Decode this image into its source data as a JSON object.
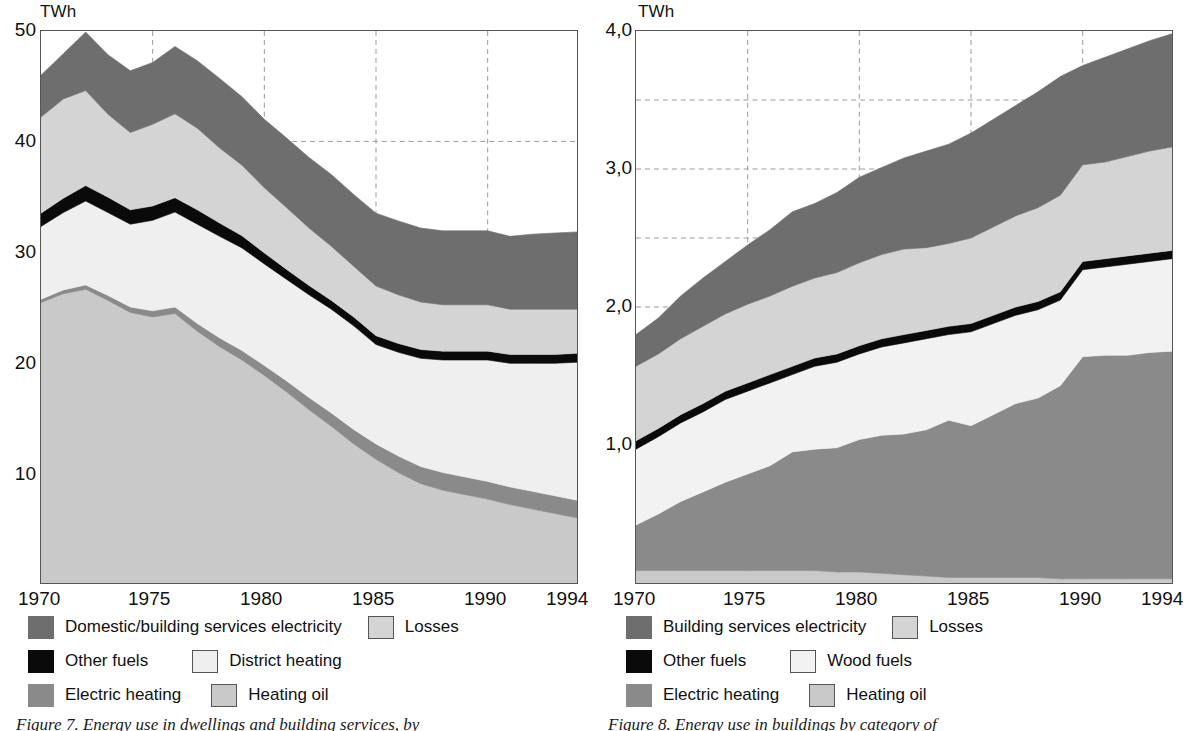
{
  "colors": {
    "services_electricity": "#6e6e6e",
    "losses": "#d4d4d4",
    "other_fuels": "#0a0a0a",
    "district_heating": "#efefef",
    "wood_fuels": "#f2f2f2",
    "electric_heating": "#8a8a8a",
    "heating_oil": "#c9c9c9",
    "axis": "#555555",
    "grid": "#9a9a9a",
    "text": "#111111"
  },
  "left": {
    "unit": "TWh",
    "yticks": [
      "50",
      "40",
      "30",
      "20",
      "10"
    ],
    "xticks": [
      "1970",
      "1975",
      "1980",
      "1985",
      "1990",
      "1994"
    ],
    "legend": [
      {
        "label": "Domestic/building services electricity",
        "swatch": "services_electricity",
        "bordered": false
      },
      {
        "label": "Losses",
        "swatch": "losses",
        "bordered": true
      },
      {
        "label": "Other fuels",
        "swatch": "other_fuels",
        "bordered": false
      },
      {
        "label": "District heating",
        "swatch": "district_heating",
        "bordered": true
      },
      {
        "label": "Electric heating",
        "swatch": "electric_heating",
        "bordered": false
      },
      {
        "label": "Heating oil",
        "swatch": "heating_oil",
        "bordered": true
      }
    ],
    "caption": "Figure 7. Energy use in dwellings and building services, by"
  },
  "right": {
    "unit": "TWh",
    "yticks": [
      "4,0",
      "3,0",
      "2,0",
      "1,0"
    ],
    "xticks": [
      "1970",
      "1975",
      "1980",
      "1985",
      "1990",
      "1994"
    ],
    "legend": [
      {
        "label": "Building services electricity",
        "swatch": "services_electricity",
        "bordered": false
      },
      {
        "label": "Losses",
        "swatch": "losses",
        "bordered": true
      },
      {
        "label": "Other fuels",
        "swatch": "other_fuels",
        "bordered": false
      },
      {
        "label": "Wood fuels",
        "swatch": "wood_fuels",
        "bordered": true
      },
      {
        "label": "Electric heating",
        "swatch": "electric_heating",
        "bordered": false
      },
      {
        "label": "Heating oil",
        "swatch": "heating_oil",
        "bordered": true
      }
    ],
    "caption": "Figure 8. Energy use in buildings by category of"
  },
  "chart_data": [
    {
      "id": "left-chart",
      "type": "area",
      "title": "",
      "xlabel": "",
      "ylabel": "TWh",
      "unit": "TWh",
      "stacked": true,
      "grid": "dashed",
      "legend_position": "below",
      "xlim": [
        1970,
        1994
      ],
      "ylim": [
        0,
        50
      ],
      "ytick_values": [
        10,
        20,
        30,
        40,
        50
      ],
      "xtick_values": [
        1970,
        1975,
        1980,
        1985,
        1990,
        1994
      ],
      "x": [
        1970,
        1971,
        1972,
        1973,
        1974,
        1975,
        1976,
        1977,
        1978,
        1979,
        1980,
        1981,
        1982,
        1983,
        1984,
        1985,
        1986,
        1987,
        1988,
        1989,
        1990,
        1991,
        1992,
        1993,
        1994
      ],
      "series": [
        {
          "name": "Heating oil",
          "color_key": "heating_oil",
          "values": [
            25.4,
            26.2,
            26.6,
            25.6,
            24.5,
            24.1,
            24.4,
            22.8,
            21.4,
            20.2,
            18.8,
            17.3,
            15.7,
            14.2,
            12.6,
            11.2,
            10.0,
            9.0,
            8.4,
            8.0,
            7.6,
            7.1,
            6.7,
            6.3,
            5.9
          ]
        },
        {
          "name": "Electric heating",
          "color_key": "electric_heating",
          "values": [
            0.3,
            0.35,
            0.4,
            0.45,
            0.5,
            0.55,
            0.6,
            0.7,
            0.8,
            0.85,
            0.9,
            1.0,
            1.1,
            1.2,
            1.3,
            1.4,
            1.5,
            1.55,
            1.6,
            1.6,
            1.6,
            1.6,
            1.6,
            1.6,
            1.6
          ]
        },
        {
          "name": "District heating",
          "color_key": "district_heating",
          "values": [
            6.6,
            7.0,
            7.6,
            7.5,
            7.5,
            8.2,
            8.6,
            9.0,
            9.2,
            9.3,
            9.2,
            9.2,
            9.3,
            9.4,
            9.4,
            9.0,
            9.4,
            9.8,
            10.2,
            10.6,
            11.0,
            11.2,
            11.6,
            12.0,
            12.5
          ]
        },
        {
          "name": "Other fuels",
          "color_key": "other_fuels",
          "values": [
            1.2,
            1.3,
            1.4,
            1.4,
            1.3,
            1.3,
            1.3,
            1.3,
            1.2,
            1.1,
            1.0,
            0.9,
            0.85,
            0.8,
            0.8,
            0.8,
            0.8,
            0.8,
            0.8,
            0.8,
            0.8,
            0.8,
            0.8,
            0.8,
            0.8
          ]
        },
        {
          "name": "Losses",
          "color_key": "losses",
          "values": [
            8.7,
            9.0,
            8.6,
            7.5,
            7.0,
            7.4,
            7.6,
            7.4,
            6.8,
            6.4,
            5.9,
            5.6,
            5.2,
            4.9,
            4.6,
            4.5,
            4.4,
            4.3,
            4.2,
            4.2,
            4.2,
            4.1,
            4.1,
            4.1,
            4.0
          ]
        },
        {
          "name": "Domestic/building services electricity",
          "color_key": "services_electricity",
          "values": [
            3.8,
            4.1,
            5.3,
            5.4,
            5.6,
            5.6,
            6.1,
            6.1,
            6.3,
            6.2,
            6.2,
            6.3,
            6.4,
            6.5,
            6.5,
            6.6,
            6.7,
            6.7,
            6.7,
            6.7,
            6.7,
            6.6,
            6.8,
            6.9,
            7.0
          ]
        }
      ]
    },
    {
      "id": "right-chart",
      "type": "area",
      "title": "",
      "xlabel": "",
      "ylabel": "TWh",
      "unit": "TWh",
      "stacked": true,
      "grid": "dashed",
      "legend_position": "below",
      "xlim": [
        1970,
        1994
      ],
      "ylim": [
        0,
        4.0
      ],
      "ytick_values": [
        1.0,
        2.0,
        3.0,
        4.0
      ],
      "minor_gridlines": [
        2.5,
        3.5
      ],
      "xtick_values": [
        1970,
        1975,
        1980,
        1985,
        1990,
        1994
      ],
      "x": [
        1970,
        1971,
        1972,
        1973,
        1974,
        1975,
        1976,
        1977,
        1978,
        1979,
        1980,
        1981,
        1982,
        1983,
        1984,
        1985,
        1986,
        1987,
        1988,
        1989,
        1990,
        1991,
        1992,
        1993,
        1994
      ],
      "series": [
        {
          "name": "Heating oil",
          "color_key": "heating_oil",
          "values": [
            0.09,
            0.09,
            0.09,
            0.09,
            0.09,
            0.09,
            0.09,
            0.09,
            0.09,
            0.08,
            0.08,
            0.07,
            0.06,
            0.05,
            0.04,
            0.04,
            0.04,
            0.04,
            0.04,
            0.03,
            0.03,
            0.03,
            0.03,
            0.03,
            0.03
          ]
        },
        {
          "name": "Electric heating",
          "color_key": "electric_heating",
          "values": [
            0.33,
            0.41,
            0.5,
            0.57,
            0.64,
            0.7,
            0.76,
            0.86,
            0.88,
            0.9,
            0.96,
            1.0,
            1.02,
            1.06,
            1.14,
            1.1,
            1.18,
            1.26,
            1.3,
            1.4,
            1.61,
            1.62,
            1.62,
            1.64,
            1.65
          ]
        },
        {
          "name": "Wood fuels",
          "color_key": "wood_fuels",
          "values": [
            0.55,
            0.56,
            0.57,
            0.58,
            0.6,
            0.6,
            0.6,
            0.56,
            0.6,
            0.62,
            0.62,
            0.64,
            0.66,
            0.66,
            0.62,
            0.68,
            0.66,
            0.64,
            0.64,
            0.62,
            0.63,
            0.64,
            0.66,
            0.66,
            0.67
          ]
        },
        {
          "name": "Other fuels",
          "color_key": "other_fuels",
          "values": [
            0.06,
            0.06,
            0.06,
            0.06,
            0.06,
            0.06,
            0.06,
            0.06,
            0.06,
            0.06,
            0.06,
            0.06,
            0.06,
            0.06,
            0.06,
            0.06,
            0.06,
            0.06,
            0.06,
            0.06,
            0.06,
            0.06,
            0.06,
            0.06,
            0.06
          ]
        },
        {
          "name": "Losses",
          "color_key": "losses",
          "values": [
            0.54,
            0.54,
            0.55,
            0.56,
            0.56,
            0.57,
            0.57,
            0.58,
            0.58,
            0.59,
            0.6,
            0.61,
            0.62,
            0.6,
            0.6,
            0.62,
            0.64,
            0.66,
            0.68,
            0.7,
            0.7,
            0.7,
            0.72,
            0.74,
            0.75
          ]
        },
        {
          "name": "Building services electricity",
          "color_key": "services_electricity",
          "values": [
            0.23,
            0.26,
            0.31,
            0.35,
            0.38,
            0.43,
            0.48,
            0.54,
            0.54,
            0.58,
            0.62,
            0.63,
            0.66,
            0.7,
            0.72,
            0.76,
            0.78,
            0.8,
            0.84,
            0.86,
            0.72,
            0.76,
            0.78,
            0.8,
            0.82
          ]
        }
      ]
    }
  ]
}
